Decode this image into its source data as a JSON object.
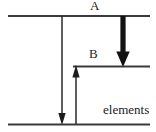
{
  "figure": {
    "background_color": "#ffffff",
    "line_color": "#3a3a3a",
    "arrow_color": "#1c1c1c",
    "text_color": "#1c1c1c"
  },
  "levels": [
    {
      "id": "A",
      "label": "A",
      "y": 16,
      "x_start": 8,
      "x_end": 150
    },
    {
      "id": "B",
      "label": "B",
      "y": 66,
      "x_start": 73,
      "x_end": 150
    },
    {
      "id": "ground",
      "label": "elements",
      "y": 124,
      "x_start": 8,
      "x_end": 150
    }
  ],
  "arrows": [
    {
      "id": "thin-down-arrow",
      "name": "transition-A-to-ground",
      "direction": "down",
      "x": 62,
      "y_start": 16,
      "y_end": 124,
      "weight": "thin"
    },
    {
      "id": "thin-up-arrow",
      "name": "transition-ground-to-B",
      "direction": "up",
      "x": 76,
      "y_start": 124,
      "y_end": 66,
      "weight": "thin"
    },
    {
      "id": "thick-down-arrow",
      "name": "transition-A-to-B",
      "direction": "down",
      "x": 123,
      "y_start": 16,
      "y_end": 66,
      "weight": "thick"
    }
  ],
  "labels": {
    "level_a": "A",
    "level_b": "B",
    "ground_level": "elements"
  }
}
